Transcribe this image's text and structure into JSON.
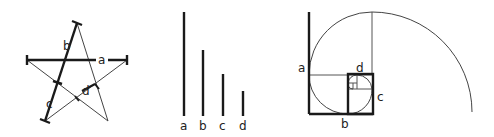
{
  "figure": {
    "panels": [
      {
        "name": "pentagram",
        "labels": {
          "a": "a",
          "b": "b",
          "c": "c",
          "d": "d"
        }
      },
      {
        "name": "segment-bars",
        "labels": [
          "a",
          "b",
          "c",
          "d"
        ]
      },
      {
        "name": "golden-spiral",
        "labels": {
          "a": "a",
          "b": "b",
          "c": "c",
          "d": "d"
        }
      }
    ],
    "colors": {
      "stroke": "#1a1a1a",
      "thin_stroke": "#444444",
      "background": "#ffffff"
    }
  }
}
